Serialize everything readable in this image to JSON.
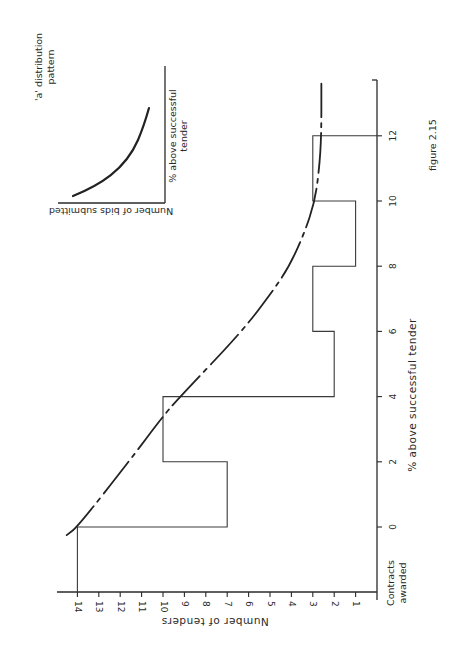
{
  "figure_label": "figure 2.15",
  "main_chart": {
    "x_axis_label": "% above successful tender",
    "y_axis_label": "Number of tenders",
    "contracts_label_line1": "Contracts",
    "contracts_label_line2": "awarded"
  },
  "inset": {
    "title_line1": "'a' distribution",
    "title_line2": "pattern",
    "x_label": "Number of bids submitted",
    "y_label_line1": "% above successful",
    "y_label_line2": "tender"
  },
  "chart_data": [
    {
      "type": "bar",
      "title": "figure 2.15",
      "orientation": "rotated 90 degrees (histogram of tenders vs % above successful tender)",
      "xlabel": "% above successful tender",
      "ylabel": "Number of tenders",
      "x_ticks": [
        0,
        2,
        4,
        6,
        8,
        10,
        12
      ],
      "y_ticks": [
        1,
        2,
        3,
        4,
        5,
        6,
        7,
        8,
        9,
        10,
        11,
        12,
        13,
        14
      ],
      "xlim": [
        -2,
        13.5
      ],
      "ylim": [
        0,
        15
      ],
      "contracts_awarded": 14,
      "categories": [
        "Contracts awarded",
        "0-2",
        "2-4",
        "4-6",
        "6-8",
        "8-10",
        "10-12"
      ],
      "bins": [
        {
          "from": -2,
          "to": 0,
          "value": 14,
          "label": "Contracts awarded"
        },
        {
          "from": 0,
          "to": 2,
          "value": 7
        },
        {
          "from": 2,
          "to": 4,
          "value": 10
        },
        {
          "from": 4,
          "to": 6,
          "value": 2
        },
        {
          "from": 6,
          "to": 8,
          "value": 3
        },
        {
          "from": 8,
          "to": 10,
          "value": 1
        },
        {
          "from": 10,
          "to": 12,
          "value": 3
        }
      ],
      "values": [
        14,
        7,
        10,
        2,
        3,
        1,
        3
      ],
      "fitted_curve": {
        "style": "dashed",
        "points": [
          [
            -0.25,
            14.5
          ],
          [
            0,
            14.0
          ],
          [
            2,
            11.6
          ],
          [
            3.4,
            10.0
          ],
          [
            4,
            9.2
          ],
          [
            6,
            6.3
          ],
          [
            7.3,
            4.8
          ],
          [
            8,
            4.1
          ],
          [
            9,
            3.4
          ],
          [
            10,
            2.9
          ],
          [
            11,
            2.7
          ],
          [
            12,
            2.6
          ],
          [
            13.6,
            2.6
          ]
        ]
      },
      "grid": false
    },
    {
      "type": "line",
      "title": "'a' distribution pattern",
      "xlabel": "Number of bids submitted",
      "ylabel": "% above successful tender",
      "description": "decreasing convex curve"
    }
  ]
}
